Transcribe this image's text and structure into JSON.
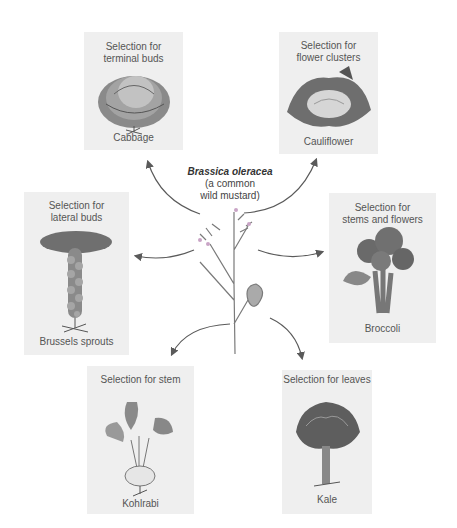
{
  "ancestor": {
    "scientific_name": "Brassica oleracea",
    "common_name": "(a common\nwild mustard)"
  },
  "varieties": [
    {
      "id": "cabbage",
      "selection": "Selection for\nterminal buds",
      "name": "Cabbage"
    },
    {
      "id": "cauliflower",
      "selection": "Selection for\nflower clusters",
      "name": "Cauliflower"
    },
    {
      "id": "brussels-sprouts",
      "selection": "Selection for\nlateral buds",
      "name": "Brussels sprouts"
    },
    {
      "id": "broccoli",
      "selection": "Selection for\nstems and flowers",
      "name": "Broccoli"
    },
    {
      "id": "kohlrabi",
      "selection": "Selection for stem",
      "name": "Kohlrabi"
    },
    {
      "id": "kale",
      "selection": "Selection for leaves",
      "name": "Kale"
    }
  ],
  "colors": {
    "card_bg": "#efefef",
    "arrow": "#5a5a5a",
    "plant_stem": "#7a7a7a",
    "text": "#555555"
  }
}
